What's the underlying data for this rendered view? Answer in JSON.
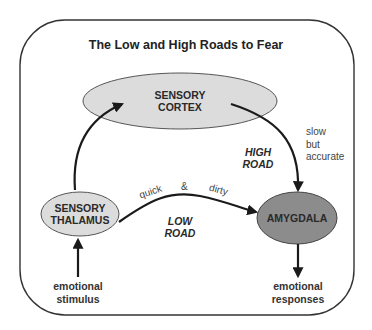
{
  "title": "The Low and High Roads to Fear",
  "nodes": {
    "cortex": {
      "line1": "SENSORY",
      "line2": "CORTEX",
      "fill": "#dcdcdc"
    },
    "thalamus": {
      "line1": "SENSORY",
      "line2": "THALAMUS",
      "fill": "#dcdcdc"
    },
    "amygdala": {
      "label": "AMYGDALA",
      "fill": "#8c8c8c"
    }
  },
  "roads": {
    "high": {
      "line1": "HIGH",
      "line2": "ROAD",
      "note1": "slow",
      "note2": "but",
      "note3": "accurate"
    },
    "low": {
      "line1": "LOW",
      "line2": "ROAD",
      "note1": "quick",
      "note2": "&",
      "note3": "dirty"
    }
  },
  "input": {
    "line1": "emotional",
    "line2": "stimulus"
  },
  "output": {
    "line1": "emotional",
    "line2": "responses"
  }
}
